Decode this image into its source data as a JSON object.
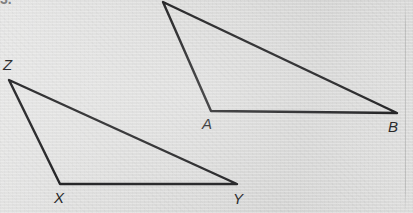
{
  "figure": {
    "kind": "geometry-diagram",
    "problem_number": "3.",
    "background_color": "#dadad9",
    "stroke_color": "#19191b",
    "label_color": "#1c1c1e",
    "stroke_width": 2.4,
    "canvas": {
      "width": 413,
      "height": 213
    },
    "triangles": [
      {
        "name": "triangle-abc",
        "vertex_keys": [
          "apex",
          "A",
          "B"
        ],
        "points": "163,2 211,111 397,113",
        "vertices": [
          {
            "key": "apex",
            "label": "",
            "x": 163,
            "y": 2,
            "labeled": false
          },
          {
            "key": "A",
            "label": "A",
            "x": 211,
            "y": 111,
            "labeled": true
          },
          {
            "key": "B",
            "label": "B",
            "x": 397,
            "y": 113,
            "labeled": true
          }
        ]
      },
      {
        "name": "triangle-xyz",
        "vertex_keys": [
          "Z",
          "X",
          "Y"
        ],
        "points": "9,80 60,184 237,184",
        "vertices": [
          {
            "key": "Z",
            "label": "Z",
            "x": 9,
            "y": 80,
            "labeled": true
          },
          {
            "key": "X",
            "label": "X",
            "x": 60,
            "y": 184,
            "labeled": true
          },
          {
            "key": "Y",
            "label": "Y",
            "x": 237,
            "y": 184,
            "labeled": true
          }
        ]
      }
    ],
    "labels": [
      {
        "name": "vertex-label-z",
        "text": "Z",
        "left": 3,
        "top": 57
      },
      {
        "name": "vertex-label-x",
        "text": "X",
        "left": 54,
        "top": 190
      },
      {
        "name": "vertex-label-y",
        "text": "Y",
        "left": 233,
        "top": 191
      },
      {
        "name": "vertex-label-a",
        "text": "A",
        "left": 202,
        "top": 116
      },
      {
        "name": "vertex-label-b",
        "text": "B",
        "left": 388,
        "top": 119
      }
    ],
    "artifacts": [
      {
        "name": "page-edge-line",
        "left": 405
      }
    ]
  }
}
